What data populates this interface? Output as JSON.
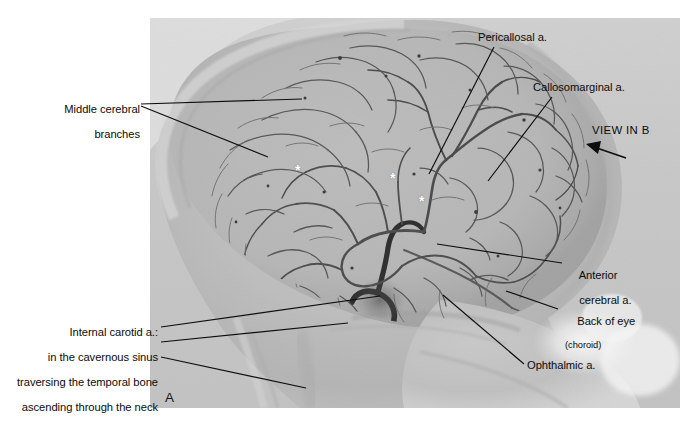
{
  "figure": {
    "panel_letter": "A",
    "modality": "cerebral angiogram (lateral internal carotid injection)",
    "background_color": "#ffffff",
    "film_tone_color": "#b9b9b9",
    "vessel_color": "#4a4a4a",
    "leader_line_color": "#101010",
    "asterisk_color": "#ffffff",
    "asterisk_glyph": "*"
  },
  "labels": {
    "middle_cerebral_branches": {
      "line1": "Middle cerebral",
      "line2": "branches"
    },
    "pericallosal": "Pericallosal a.",
    "callosomarginal": "Callosomarginal a.",
    "view_in_b": "VIEW IN B",
    "anterior_cerebral": {
      "line1": "Anterior",
      "line2": "cerebral a."
    },
    "back_of_eye": {
      "line1": "Back of eye",
      "line2": "(choroid)"
    },
    "ophthalmic": "Ophthalmic a.",
    "internal_carotid": {
      "heading": "Internal carotid a.:",
      "line2": "in the cavernous sinus",
      "line3": "traversing the temporal bone",
      "line4": "ascending through the neck"
    }
  },
  "markers": {
    "asterisks": [
      {
        "id": "asterisk-1",
        "x": 299,
        "y": 174
      },
      {
        "id": "asterisk-2",
        "x": 394,
        "y": 182
      },
      {
        "id": "asterisk-3",
        "x": 423,
        "y": 205
      }
    ]
  }
}
